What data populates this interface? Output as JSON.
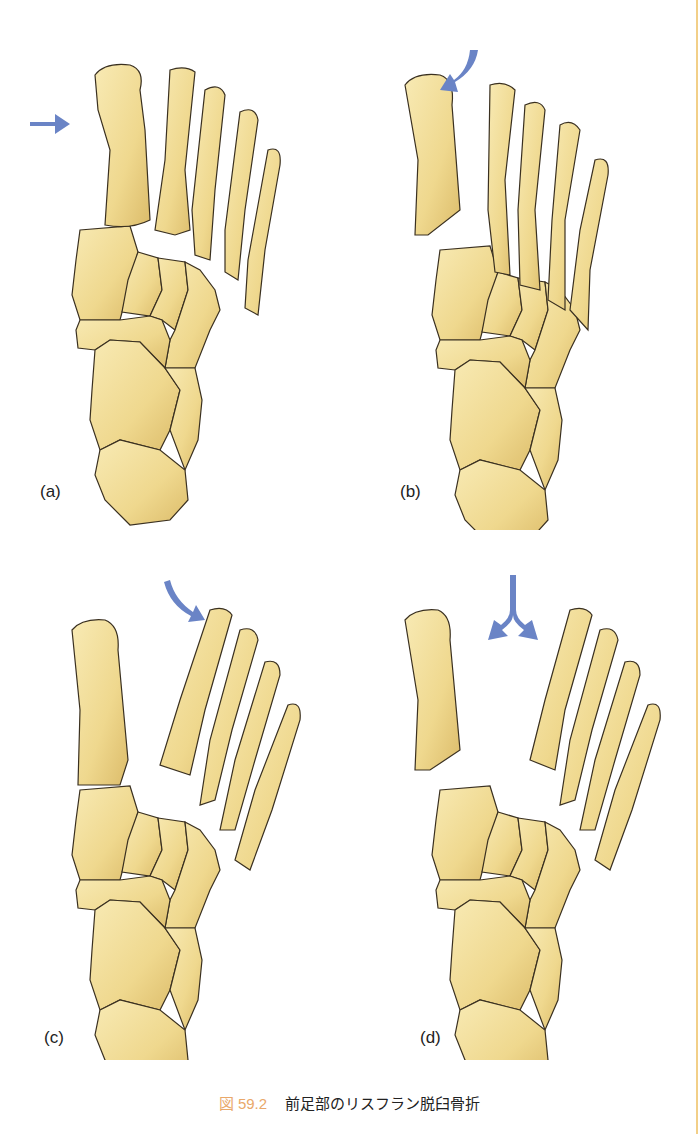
{
  "figure": {
    "number": "図 59.2",
    "title": "前足部のリスフラン脱臼骨折"
  },
  "panels": [
    {
      "label": "(a)",
      "arrow": "straight-right-arrow",
      "description": "homolateral"
    },
    {
      "label": "(b)",
      "arrow": "curved-down-left-arrow",
      "description": "lateral displacement of lesser metatarsals"
    },
    {
      "label": "(c)",
      "arrow": "curved-down-right-arrow",
      "description": "lateral displacement"
    },
    {
      "label": "(d)",
      "arrow": "divergent-split-arrow",
      "description": "divergent"
    }
  ],
  "colors": {
    "bone_fill": "#f1dc96",
    "bone_shade": "#d9b865",
    "bone_outline": "#3a3020",
    "arrow": "#6a84c6",
    "caption_accent": "#e9a86a",
    "page_edge": "#f2cf88"
  }
}
